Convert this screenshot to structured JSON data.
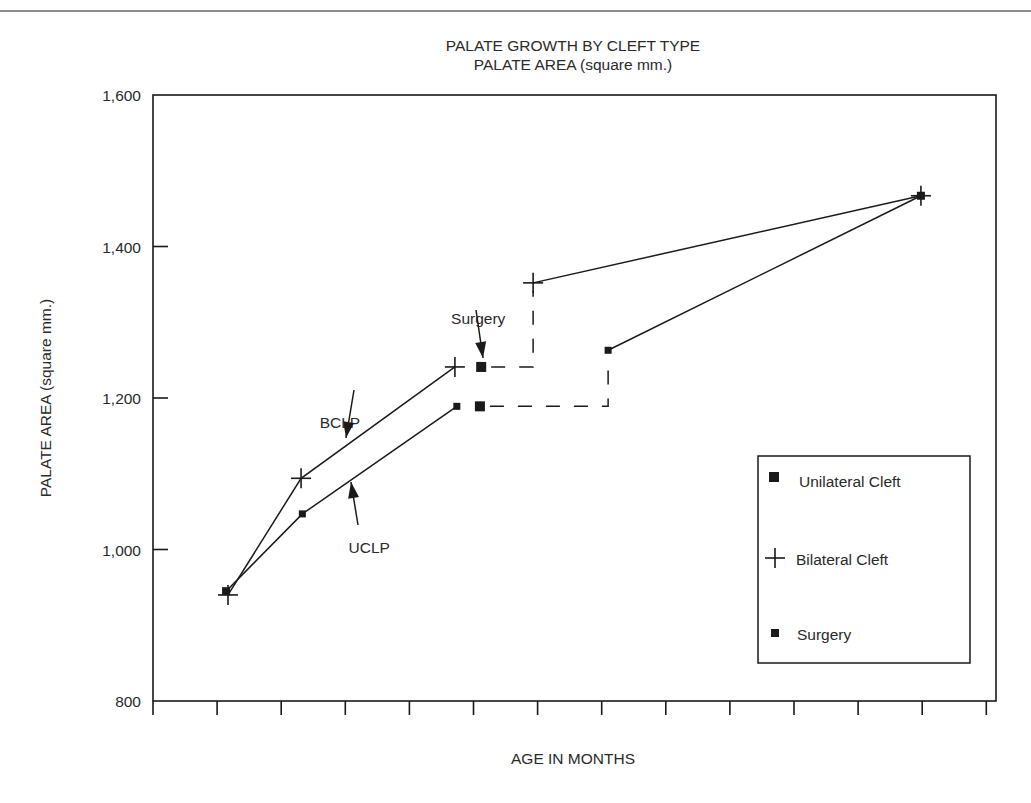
{
  "chart_data": {
    "type": "line",
    "title": "PALATE GROWTH BY CLEFT TYPE",
    "subtitle": "PALATE AREA (square mm.)",
    "xlabel": "AGE IN MONTHS",
    "ylabel": "PALATE AREA (square mm.)",
    "ylim": [
      800,
      1600
    ],
    "yticks": [
      800,
      1000,
      1200,
      1400,
      1600
    ],
    "ytick_labels": [
      "800",
      "1,000",
      "1,200",
      "1,400",
      "1,600"
    ],
    "xticks_count": 14,
    "xtick_labels": [],
    "grid": false,
    "legend_position": "lower right inside",
    "x_units_note": "x in tick-interval units (no tick labels shown)",
    "series": [
      {
        "name": "Bilateral Cleft",
        "label": "BCLP",
        "marker": "plus",
        "points": [
          {
            "x": 1.17,
            "y": 940
          },
          {
            "x": 2.31,
            "y": 1094
          },
          {
            "x": 4.71,
            "y": 1241
          },
          {
            "x": 5.93,
            "y": 1352
          },
          {
            "x": 11.98,
            "y": 1467
          }
        ],
        "dashed_segment_after_index": 2,
        "surgery": {
          "x": 5.12,
          "y": 1241
        }
      },
      {
        "name": "Unilateral Cleft",
        "label": "UCLP",
        "marker": "square",
        "points": [
          {
            "x": 1.14,
            "y": 945
          },
          {
            "x": 2.33,
            "y": 1047
          },
          {
            "x": 4.74,
            "y": 1189
          },
          {
            "x": 7.1,
            "y": 1263
          },
          {
            "x": 11.98,
            "y": 1467
          }
        ],
        "dashed_segment_after_index": 2,
        "surgery": {
          "x": 5.1,
          "y": 1189
        }
      }
    ],
    "annotations": [
      {
        "text": "Surgery",
        "x": 4.65,
        "y": 1298
      },
      {
        "text": "BCLP",
        "x": 2.6,
        "y": 1160
      },
      {
        "text": "UCLP",
        "x": 3.05,
        "y": 995
      }
    ]
  },
  "legend": {
    "items": [
      {
        "marker": "square",
        "label": "Unilateral Cleft"
      },
      {
        "marker": "plus",
        "label": "Bilateral Cleft"
      },
      {
        "marker": "small-square",
        "label": "Surgery"
      }
    ]
  },
  "colors": {
    "ink": "#1a1a1a",
    "text": "#2a2a2a",
    "top_rule": "#8c8c8c",
    "background": "#ffffff"
  }
}
